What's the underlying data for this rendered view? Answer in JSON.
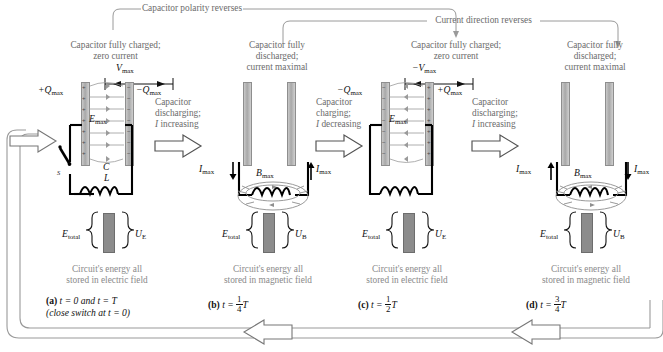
{
  "figure": {
    "top_brackets": [
      {
        "id": "polarity",
        "label": "Capacitor polarity reverses"
      },
      {
        "id": "current",
        "label": "Current direction reverses"
      }
    ],
    "bottom_loop": {
      "label": ""
    }
  },
  "panels": [
    {
      "id": "a",
      "headline": "Capacitor fully charged;\nzero current",
      "headline_line1": "Capacitor fully charged;",
      "headline_line2": "zero current",
      "voltage_label": "V",
      "voltage_sub": "max",
      "voltage_sign": "",
      "charge_left": "+Q",
      "charge_left_sub": "max",
      "charge_right": "−Q",
      "charge_right_sub": "max",
      "field_label": "E",
      "field_sub": "max",
      "cap_label": "C",
      "ind_label": "L",
      "switch_label": "S",
      "energy_left": "E",
      "energy_left_sub": "total",
      "energy_right": "U",
      "energy_right_sub": "E",
      "note_line1": "Circuit's energy all",
      "note_line2": "stored in electric field",
      "caption_bold": "(a)",
      "caption_text": " t = 0 and t = T",
      "caption_line2": "(close switch at t = 0)"
    },
    {
      "id": "b",
      "headline_line1": "Capacitor fully",
      "headline_line2": "discharged;",
      "headline_line3": "current maximal",
      "current_left": "I",
      "current_left_sub": "max",
      "current_left_dir": "down",
      "current_right": "I",
      "current_right_sub": "max",
      "current_right_dir": "up",
      "bfield_label": "B",
      "bfield_sub": "max",
      "energy_left": "E",
      "energy_left_sub": "total",
      "energy_right": "U",
      "energy_right_sub": "B",
      "note_line1": "Circuit's energy all",
      "note_line2": "stored in magnetic field",
      "caption_bold": "(b)",
      "caption_text": " t = ",
      "caption_frac_n": "1",
      "caption_frac_d": "4",
      "caption_tail": "T"
    },
    {
      "id": "c",
      "headline_line1": "Capacitor fully charged;",
      "headline_line2": "zero current",
      "voltage_label": "−V",
      "voltage_sub": "max",
      "charge_left": "−Q",
      "charge_left_sub": "max",
      "charge_right": "+Q",
      "charge_right_sub": "max",
      "field_label": "E",
      "field_sub": "max",
      "energy_left": "E",
      "energy_left_sub": "total",
      "energy_right": "U",
      "energy_right_sub": "E",
      "note_line1": "Circuit's energy all",
      "note_line2": "stored in electric field",
      "caption_bold": "(c)",
      "caption_text": " t = ",
      "caption_frac_n": "1",
      "caption_frac_d": "2",
      "caption_tail": "T"
    },
    {
      "id": "d",
      "headline_line1": "Capacitor fully",
      "headline_line2": "discharged;",
      "headline_line3": "current maximal",
      "current_left": "I",
      "current_left_sub": "max",
      "current_left_dir": "up",
      "current_right": "I",
      "current_right_sub": "max",
      "current_right_dir": "down",
      "bfield_label": "B",
      "bfield_sub": "max",
      "energy_left": "E",
      "energy_left_sub": "total",
      "energy_right": "U",
      "energy_right_sub": "B",
      "note_line1": "Circuit's energy all",
      "note_line2": "stored in magnetic field",
      "caption_bold": "(d)",
      "caption_text": " t = ",
      "caption_frac_n": "3",
      "caption_frac_d": "4",
      "caption_tail": "T"
    }
  ],
  "transitions": [
    {
      "id": "a-to-b",
      "line1": "Capacitor",
      "line2": "discharging;",
      "line3": "I increasing"
    },
    {
      "id": "b-to-c",
      "line1": "Capacitor",
      "line2": "charging;",
      "line3": "I decreasing"
    },
    {
      "id": "c-to-d",
      "line1": "Capacitor",
      "line2": "discharging;",
      "line3": "I increasing"
    }
  ],
  "colors": {
    "text_gray": "#6b6b6b",
    "text_dark": "#111111",
    "plate_fill": "#b4b4b4",
    "energy_fill": "#8c8c8c",
    "wire": "#000000",
    "field_line": "#9a9a9a"
  }
}
